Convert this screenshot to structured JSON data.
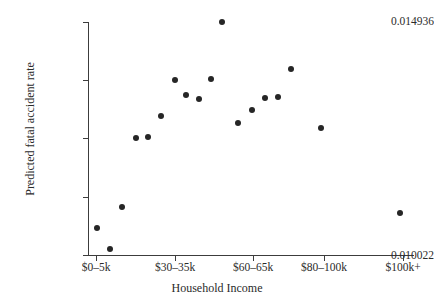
{
  "chart_data": {
    "type": "scatter",
    "title": "",
    "xlabel": "Household Income",
    "ylabel": "Predicted fatal accident rate",
    "ylim": [
      0.010022,
      0.014936
    ],
    "y_tick_labels": [
      "0.010022",
      "0.014936"
    ],
    "y_ticks_count": 5,
    "grid": false,
    "legend": null,
    "x_tick_labels": [
      "$0–5k",
      "$30–35k",
      "$60–65k",
      "$80–100k",
      "$100k+"
    ],
    "x_tick_pixels": [
      96,
      175,
      253,
      324,
      403
    ],
    "categories": [
      "$0–5k",
      "$5–10k",
      "$10–15k",
      "$15–20k",
      "$20–25k",
      "$25–30k",
      "$30–35k",
      "$35–40k",
      "$40–45k",
      "$45–50k",
      "$50–55k",
      "$55–60k",
      "$60–65k",
      "$65–70k",
      "$70–75k",
      "$75–80k",
      "$80–100k",
      "$100k+"
    ],
    "points": [
      {
        "label": "$0–5k",
        "px": 97,
        "py": 228,
        "value": 0.010593
      },
      {
        "label": "$5–10k",
        "px": 110,
        "py": 249,
        "value": 0.010149
      },
      {
        "label": "$10–15k",
        "px": 122,
        "py": 207,
        "value": 0.011035
      },
      {
        "label": "$15–20k",
        "px": 136,
        "py": 138,
        "value": 0.01249
      },
      {
        "label": "$20–25k",
        "px": 148,
        "py": 137,
        "value": 0.012511
      },
      {
        "label": "$25–30k",
        "px": 161,
        "py": 116,
        "value": 0.012954
      },
      {
        "label": "$30–35k",
        "px": 175,
        "py": 80,
        "value": 0.013713
      },
      {
        "label": "$35–40k",
        "px": 186,
        "py": 95,
        "value": 0.013397
      },
      {
        "label": "$40–45k",
        "px": 199,
        "py": 99,
        "value": 0.013313
      },
      {
        "label": "$45–50k",
        "px": 211,
        "py": 79,
        "value": 0.013734
      },
      {
        "label": "$50–55k",
        "px": 222,
        "py": 22,
        "value": 0.014936
      },
      {
        "label": "$55–60k",
        "px": 238,
        "py": 123,
        "value": 0.012806
      },
      {
        "label": "$60–65k",
        "px": 252,
        "py": 110,
        "value": 0.013081
      },
      {
        "label": "$65–70k",
        "px": 265,
        "py": 98,
        "value": 0.013334
      },
      {
        "label": "$70–75k",
        "px": 278,
        "py": 97,
        "value": 0.013355
      },
      {
        "label": "$75–80k",
        "px": 291,
        "py": 69,
        "value": 0.013945
      },
      {
        "label": "$80–100k",
        "px": 321,
        "py": 128,
        "value": 0.0127
      },
      {
        "label": "$100k+",
        "px": 400,
        "py": 213,
        "value": 0.010909
      }
    ]
  },
  "axes": {
    "x_title": "Household Income",
    "y_title": "Predicted fatal accident rate",
    "y_top_label": "0.014936",
    "y_bottom_label": "0.010022"
  },
  "colors": {
    "point": "#262626",
    "axis": "#3c3c3c",
    "text": "#2b2b2b",
    "background": "#ffffff"
  }
}
